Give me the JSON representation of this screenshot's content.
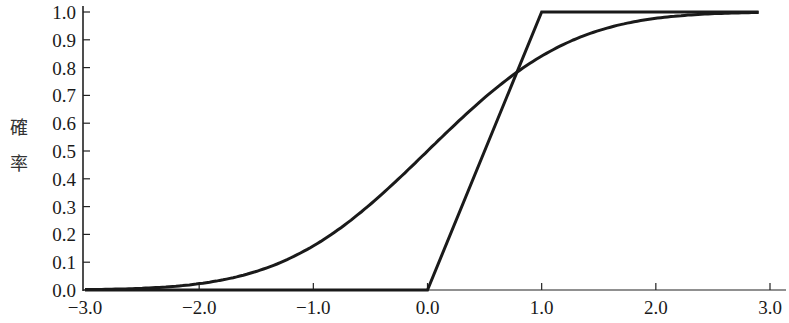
{
  "chart_data": {
    "type": "line",
    "title": "",
    "xlabel": "",
    "ylabel": "確率",
    "xlim": [
      -3.0,
      3.0
    ],
    "ylim": [
      0.0,
      1.0
    ],
    "grid": false,
    "legend": null,
    "x_ticks": [
      "−3.0",
      "−2.0",
      "−1.0",
      "0.0",
      "1.0",
      "2.0",
      "3.0"
    ],
    "y_ticks": [
      "0.0",
      "0.1",
      "0.2",
      "0.3",
      "0.4",
      "0.5",
      "0.6",
      "0.7",
      "0.8",
      "0.9",
      "1.0"
    ],
    "series": [
      {
        "name": "uniform-cdf",
        "description": "piecewise linear CDF: 0 for x<0, rises linearly to 1 at x=1, then 1",
        "x": [
          -3.0,
          0.0,
          1.0,
          2.9
        ],
        "y": [
          0.0,
          0.0,
          1.0,
          1.0
        ]
      },
      {
        "name": "smooth-cdf",
        "description": "S-shaped cumulative curve, 0.5 at x=0, crossing the linear CDF near (0.8, 0.8)",
        "x": [
          -3.0,
          -2.5,
          -2.0,
          -1.5,
          -1.0,
          -0.5,
          0.0,
          0.5,
          0.8,
          1.0,
          1.5,
          2.0,
          2.5,
          2.9
        ],
        "y": [
          0.0,
          0.01,
          0.03,
          0.07,
          0.16,
          0.31,
          0.5,
          0.69,
          0.79,
          0.84,
          0.93,
          0.98,
          0.99,
          1.0
        ]
      }
    ]
  },
  "axes": {
    "ylabel_chars": [
      "確",
      "率"
    ]
  }
}
